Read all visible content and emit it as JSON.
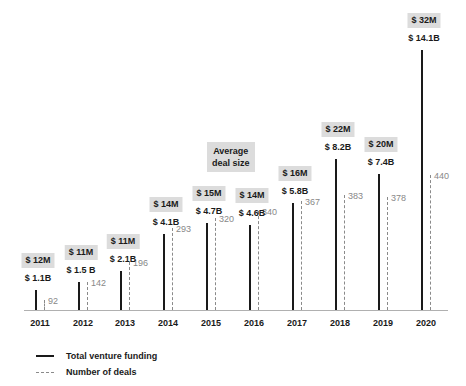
{
  "chart_data": {
    "type": "bar",
    "title": "",
    "xlabel": "",
    "ylabel": "",
    "categories": [
      "2011",
      "2012",
      "2013",
      "2014",
      "2015",
      "2016",
      "2017",
      "2018",
      "2019",
      "2020"
    ],
    "series": [
      {
        "name": "Total venture funding",
        "unit": "$B",
        "values": [
          1.1,
          1.5,
          2.1,
          4.1,
          4.7,
          4.6,
          5.8,
          8.2,
          7.4,
          14.1
        ],
        "labels": [
          "$ 1.1B",
          "$ 1.5 B",
          "$ 2.1B",
          "$ 4.1B",
          "$ 4.7B",
          "$ 4.6B",
          "$ 5.8B",
          "$ 8.2B",
          "$ 7.4B",
          "$ 14.1B"
        ]
      },
      {
        "name": "Number of deals",
        "values": [
          92,
          142,
          196,
          293,
          320,
          340,
          367,
          383,
          378,
          440
        ]
      },
      {
        "name": "Average deal size",
        "unit": "$M",
        "values": [
          12,
          11,
          11,
          14,
          15,
          14,
          16,
          22,
          20,
          32
        ],
        "labels": [
          "$ 12M",
          "$ 11M",
          "$ 11M",
          "$ 14M",
          "$ 15M",
          "$ 14M",
          "$ 16M",
          "$ 22M",
          "$ 20M",
          "$ 32M"
        ]
      }
    ],
    "annotations": [
      "Average deal size"
    ],
    "legend": {
      "position": "bottom-left",
      "entries": [
        "Total venture funding",
        "Number of deals"
      ]
    },
    "grid": false
  },
  "annotation": {
    "line1": "Average",
    "line2": "deal size"
  },
  "legend": {
    "solid_label": "Total venture funding",
    "dashed_label": "Number of deals"
  }
}
